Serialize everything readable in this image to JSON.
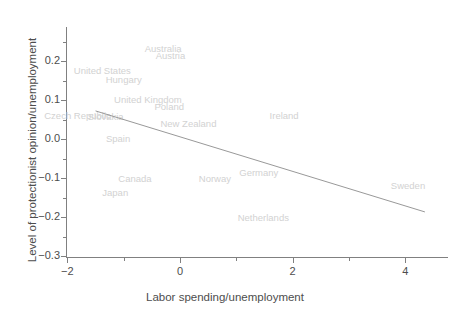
{
  "chart_data": {
    "type": "scatter",
    "title": "",
    "xlabel": "Labor spending/unemployment",
    "ylabel": "Level of protectionist opinion/unemployment",
    "xlim": [
      -2.15,
      4.75
    ],
    "ylim": [
      -0.305,
      0.275
    ],
    "xticks": [
      -2,
      0,
      2,
      4
    ],
    "xticklabels": [
      "−2",
      "0",
      "2",
      "4"
    ],
    "xticks_minor": [
      -1,
      1,
      3
    ],
    "yticks": [
      0.2,
      0.1,
      0.0,
      -0.1,
      -0.2,
      -0.3
    ],
    "yticklabels": [
      "0.2",
      "0.1",
      "0.0",
      "−0.1",
      "−0.2",
      "−0.3"
    ],
    "yticks_minor": [
      0.25,
      0.15,
      0.05,
      -0.05,
      -0.15,
      -0.25
    ],
    "grid": false,
    "legend": null,
    "label_color": "#d2d2d2",
    "axis_color": "#808080",
    "line_color": "#999999",
    "points": [
      {
        "label": "Australia",
        "x": -0.3,
        "y": 0.233
      },
      {
        "label": "Austria",
        "x": -0.17,
        "y": 0.215
      },
      {
        "label": "United States",
        "x": -1.38,
        "y": 0.178
      },
      {
        "label": "Hungary",
        "x": -1.0,
        "y": 0.154
      },
      {
        "label": "United Kingdom",
        "x": -0.57,
        "y": 0.103
      },
      {
        "label": "Poland",
        "x": -0.19,
        "y": 0.085
      },
      {
        "label": "Czech Republic",
        "x": -1.82,
        "y": 0.062
      },
      {
        "label": "Slovakia",
        "x": -1.32,
        "y": 0.059
      },
      {
        "label": "New Zealand",
        "x": 0.15,
        "y": 0.041
      },
      {
        "label": "Ireland",
        "x": 1.85,
        "y": 0.062
      },
      {
        "label": "Spain",
        "x": -1.1,
        "y": 0.003
      },
      {
        "label": "Canada",
        "x": -0.8,
        "y": -0.1
      },
      {
        "label": "Norway",
        "x": 0.62,
        "y": -0.1
      },
      {
        "label": "Germany",
        "x": 1.4,
        "y": -0.085
      },
      {
        "label": "Japan",
        "x": -1.15,
        "y": -0.136
      },
      {
        "label": "Sweden",
        "x": 4.05,
        "y": -0.118
      },
      {
        "label": "Netherlands",
        "x": 1.48,
        "y": -0.2
      }
    ],
    "fit_line": {
      "type": "linear",
      "x_start": -1.5,
      "y_start": 0.072,
      "x_end": 4.35,
      "y_end": -0.187
    }
  }
}
